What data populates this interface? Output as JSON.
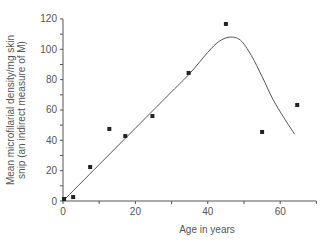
{
  "chart_data": {
    "type": "scatter",
    "title": "",
    "xlabel": "Age in years",
    "ylabel": "Mean microfilarial density/mg skin snip (an indirect measure of M)",
    "ylabel_lines": [
      "Mean microfilarial density/mg skin",
      "snip (an indirect measure of M)"
    ],
    "xlim": [
      0,
      70
    ],
    "ylim": [
      0,
      120
    ],
    "x_ticks": [
      0,
      20,
      40,
      60
    ],
    "y_ticks": [
      0,
      20,
      40,
      60,
      80,
      100,
      120
    ],
    "grid": false,
    "legend": null,
    "series": [
      {
        "name": "observed",
        "kind": "points",
        "x": [
          0.3,
          2.8,
          7.5,
          12.8,
          17.2,
          24.7,
          34.7,
          45,
          55,
          64.7
        ],
        "y": [
          1.3,
          2.6,
          22.4,
          47.5,
          42.8,
          56,
          84.4,
          116.7,
          45.5,
          63.3
        ]
      },
      {
        "name": "fitted curve",
        "kind": "line",
        "x": [
          0,
          10,
          20,
          30,
          35,
          40,
          43,
          46,
          49,
          52,
          55,
          58,
          61,
          64
        ],
        "y": [
          0,
          24,
          48,
          72,
          84,
          98,
          105,
          108,
          106,
          96,
          82,
          67,
          55,
          44
        ]
      }
    ]
  }
}
